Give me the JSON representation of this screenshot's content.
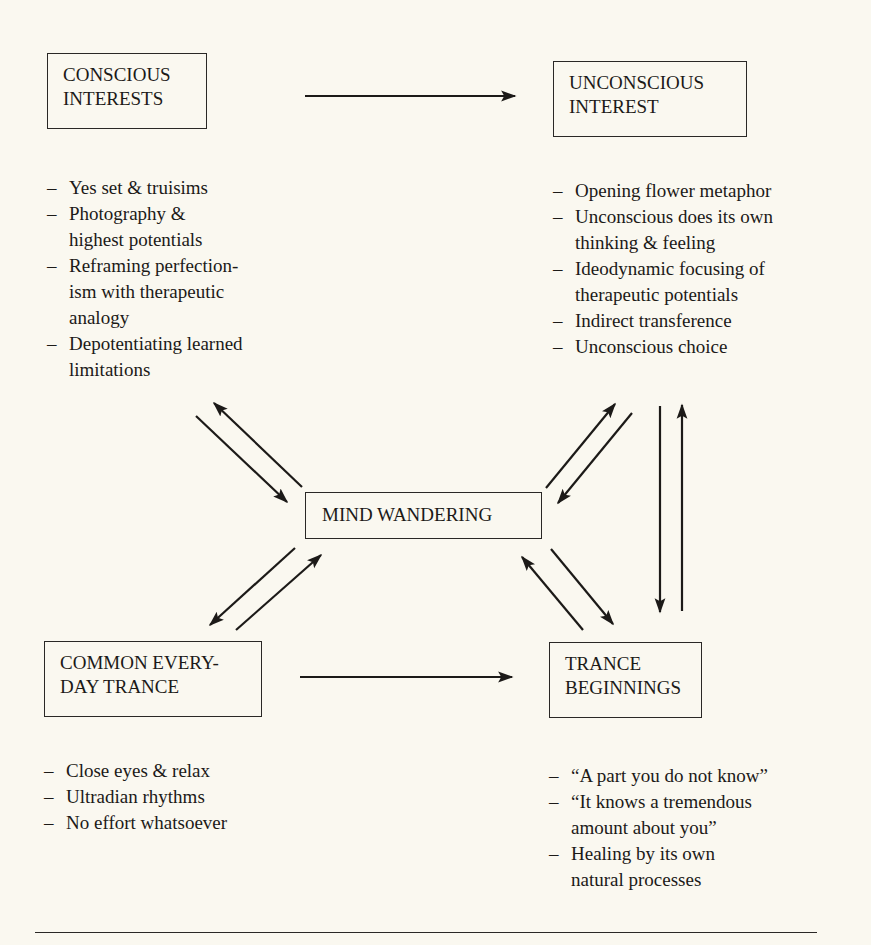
{
  "nodes": {
    "conscious_interests": {
      "lines": [
        "CONSCIOUS",
        "INTERESTS"
      ]
    },
    "unconscious_interest": {
      "lines": [
        "UNCONSCIOUS",
        "INTEREST"
      ]
    },
    "mind_wandering": {
      "lines": [
        "MIND WANDERING"
      ]
    },
    "common_everyday_trance": {
      "lines": [
        "COMMON EVERY-",
        "DAY TRANCE"
      ]
    },
    "trance_beginnings": {
      "lines": [
        "TRANCE",
        "BEGINNINGS"
      ]
    }
  },
  "lists": {
    "conscious_interests": [
      {
        "dash": "–",
        "lines": [
          "Yes set & truisims"
        ]
      },
      {
        "dash": "–",
        "lines": [
          "Photography &",
          "highest potentials"
        ]
      },
      {
        "dash": "–",
        "lines": [
          "Reframing perfection-",
          "ism with therapeutic",
          "analogy"
        ]
      },
      {
        "dash": "–",
        "lines": [
          "Depotentiating learned",
          "limitations"
        ]
      }
    ],
    "unconscious_interest": [
      {
        "dash": "–",
        "lines": [
          "Opening flower metaphor"
        ]
      },
      {
        "dash": "–",
        "lines": [
          "Unconscious does its own",
          "thinking & feeling"
        ]
      },
      {
        "dash": "–",
        "lines": [
          "Ideodynamic focusing of",
          "therapeutic potentials"
        ]
      },
      {
        "dash": "–",
        "lines": [
          "Indirect transference"
        ]
      },
      {
        "dash": "–",
        "lines": [
          "Unconscious choice"
        ]
      }
    ],
    "common_everyday_trance": [
      {
        "dash": "–",
        "lines": [
          "Close eyes & relax"
        ]
      },
      {
        "dash": "–",
        "lines": [
          "Ultradian rhythms"
        ]
      },
      {
        "dash": "–",
        "lines": [
          "No effort whatsoever"
        ]
      }
    ],
    "trance_beginnings": [
      {
        "dash": "–",
        "lines": [
          "“A part you do not know”"
        ]
      },
      {
        "dash": "–",
        "lines": [
          "“It knows a tremendous",
          "amount about you”"
        ]
      },
      {
        "dash": "–",
        "lines": [
          "Healing by its own",
          "natural processes"
        ]
      }
    ]
  },
  "edges": [
    {
      "from": "conscious_interests",
      "to": "unconscious_interest"
    },
    {
      "from": "common_everyday_trance",
      "to": "trance_beginnings"
    },
    {
      "from": "conscious_interests",
      "to": "mind_wandering"
    },
    {
      "from": "mind_wandering",
      "to": "conscious_interests"
    },
    {
      "from": "unconscious_interest",
      "to": "mind_wandering"
    },
    {
      "from": "mind_wandering",
      "to": "unconscious_interest"
    },
    {
      "from": "mind_wandering",
      "to": "common_everyday_trance"
    },
    {
      "from": "common_everyday_trance",
      "to": "mind_wandering"
    },
    {
      "from": "mind_wandering",
      "to": "trance_beginnings"
    },
    {
      "from": "trance_beginnings",
      "to": "mind_wandering"
    },
    {
      "from": "unconscious_interest",
      "to": "trance_beginnings"
    },
    {
      "from": "trance_beginnings",
      "to": "unconscious_interest"
    }
  ],
  "colors": {
    "background": "#faf8f0",
    "ink": "#1c1a18"
  }
}
